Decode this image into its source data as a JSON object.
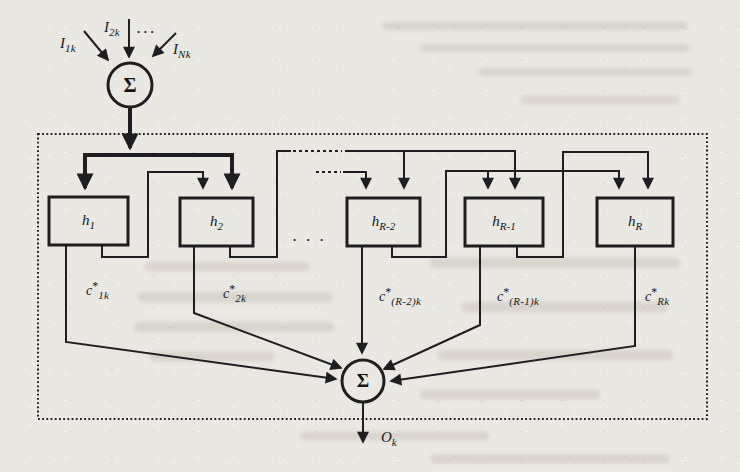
{
  "figure": {
    "colors": {
      "paper": "#eae8e3",
      "ink": "#1e1e20"
    },
    "top_sum": {
      "symbol": "Σ"
    },
    "bottom_sum": {
      "symbol": "Σ"
    },
    "inputs": [
      {
        "base": "I",
        "sub": "1k"
      },
      {
        "base": "I",
        "sub": "2k"
      },
      {
        "base": "I",
        "sub": "Nk"
      }
    ],
    "input_ellipsis": "...",
    "mid_ellipsis": ". . .",
    "blocks": [
      {
        "base": "h",
        "sub": "1"
      },
      {
        "base": "h",
        "sub": "2"
      },
      {
        "base": "h",
        "sub": "R-2"
      },
      {
        "base": "h",
        "sub": "R-1"
      },
      {
        "base": "h",
        "sub": "R"
      }
    ],
    "weights": [
      {
        "base": "c",
        "sup": "*",
        "sub": "1k"
      },
      {
        "base": "c",
        "sup": "*",
        "sub": "2k"
      },
      {
        "base": "c",
        "sup": "*",
        "sub": "(R-2)k"
      },
      {
        "base": "c",
        "sup": "*",
        "sub": "(R-1)k"
      },
      {
        "base": "c",
        "sup": "*",
        "sub": "Rk"
      }
    ],
    "output": {
      "base": "O",
      "sub": "k"
    }
  }
}
